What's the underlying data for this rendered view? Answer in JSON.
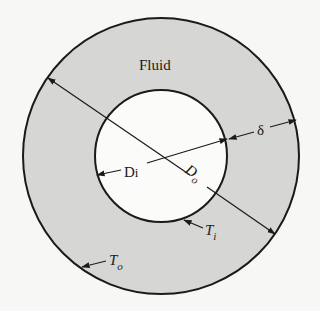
{
  "diagram": {
    "region_label": "Fluid",
    "labels": {
      "delta": "δ",
      "inner_diameter": {
        "main": "D",
        "sub": "i"
      },
      "outer_diameter": {
        "main": "D",
        "sub": "o"
      },
      "inner_temperature": {
        "main": "T",
        "sub": "i"
      },
      "outer_temperature": {
        "main": "T",
        "sub": "o"
      }
    },
    "colors": {
      "background": "#f7f7f5",
      "annulus_fill": "#d6d6d4",
      "inner_fill": "#fbfbfa",
      "stroke": "#1a1a1a"
    },
    "geometry": {
      "center": [
        161,
        156
      ],
      "outer_radius": 138,
      "inner_radius": 66
    }
  }
}
